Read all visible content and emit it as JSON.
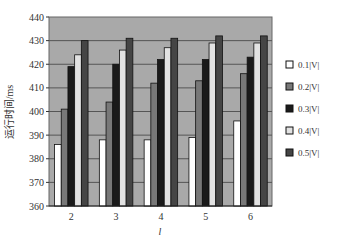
{
  "chart_data": {
    "type": "bar",
    "title": "",
    "xlabel": "l",
    "ylabel": "运行时间/ms",
    "ylim": [
      360,
      440
    ],
    "yticks": [
      360,
      370,
      380,
      390,
      400,
      410,
      420,
      430,
      440
    ],
    "grid": true,
    "legend_position": "right",
    "categories": [
      "2",
      "3",
      "4",
      "5",
      "6"
    ],
    "series": [
      {
        "name": "0.1|V|",
        "color": "#ffffff",
        "values": [
          386,
          388,
          388,
          389,
          396
        ]
      },
      {
        "name": "0.2|V|",
        "color": "#787878",
        "values": [
          401,
          404,
          412,
          413,
          416
        ]
      },
      {
        "name": "0.3|V|",
        "color": "#1a1a1a",
        "values": [
          419,
          420,
          422,
          422,
          423
        ]
      },
      {
        "name": "0.4|V|",
        "color": "#e2e2e2",
        "values": [
          424,
          426,
          427,
          429,
          429
        ]
      },
      {
        "name": "0.5|V|",
        "color": "#454545",
        "values": [
          430,
          431,
          431,
          432,
          432
        ]
      }
    ]
  },
  "style": {
    "plot_bg": "#a9a9a9",
    "grid_color": "#555555",
    "bar_stroke": "#111111"
  }
}
